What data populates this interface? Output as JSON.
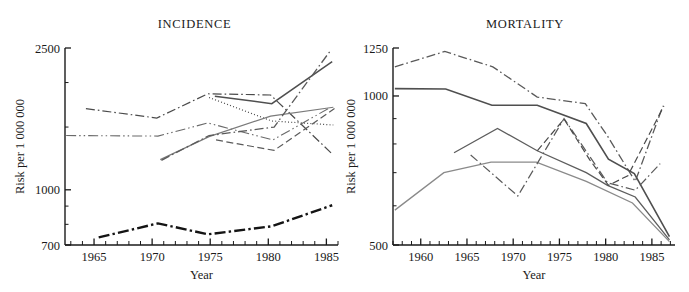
{
  "figure": {
    "panels": [
      "incidence",
      "mortality"
    ]
  },
  "chart_data": [
    {
      "type": "line",
      "title": "INCIDENCE",
      "xlabel": "Year",
      "ylabel": "Risk per 1 000 000",
      "yscale": "log",
      "ylim": [
        700,
        2500
      ],
      "ytick_labels": [
        "2500",
        "1000",
        "700"
      ],
      "ytick_values": [
        2500,
        1000,
        700
      ],
      "y_minor_ticks": [
        2000,
        1500,
        900,
        800
      ],
      "xlim": [
        1962.5,
        1986
      ],
      "xtick_labels": [
        "1965",
        "1970",
        "1975",
        "1980",
        "1985"
      ],
      "xtick_values": [
        1965,
        1970,
        1975,
        1980,
        1985
      ],
      "x_minor_interval": 1,
      "grid": false,
      "legend": "none",
      "series": [
        {
          "name": "series-1",
          "style": "dashdot",
          "color": "#4b4b4b",
          "width": 1.2,
          "x": [
            1964.3,
            1970.4,
            1974.8,
            1980.2,
            1985.4
          ],
          "y": [
            1690,
            1590,
            1860,
            1845,
            1270
          ]
        },
        {
          "name": "series-2",
          "style": "dashdotdot",
          "color": "#6a6a6a",
          "width": 1.1,
          "x": [
            1962.6,
            1970.5,
            1974.8,
            1980.4,
            1985.3
          ],
          "y": [
            1420,
            1415,
            1540,
            1380,
            1700
          ]
        },
        {
          "name": "series-3",
          "style": "dotted",
          "color": "#4b4b4b",
          "width": 1.2,
          "x": [
            1974.9,
            1980.3,
            1985.6
          ],
          "y": [
            1815,
            1560,
            1520
          ]
        },
        {
          "name": "series-4",
          "style": "solid",
          "color": "#4f4f4f",
          "width": 1.5,
          "x": [
            1975.4,
            1980.3,
            1985.5
          ],
          "y": [
            1830,
            1745,
            2290
          ]
        },
        {
          "name": "series-5",
          "style": "solid",
          "color": "#7a7a7a",
          "width": 1.2,
          "x": [
            1970.7,
            1974.9,
            1980.2,
            1985.6
          ],
          "y": [
            1215,
            1410,
            1610,
            1705
          ]
        },
        {
          "name": "series-6",
          "style": "dashdot",
          "color": "#5a5a5a",
          "width": 1.3,
          "x": [
            1970.8,
            1974.9,
            1980.5,
            1985.4
          ],
          "y": [
            1210,
            1420,
            1500,
            2470
          ]
        },
        {
          "name": "series-7",
          "style": "dashed",
          "color": "#5a5a5a",
          "width": 1.2,
          "x": [
            1975.5,
            1980.5,
            1985.7
          ],
          "y": [
            1380,
            1290,
            1690
          ]
        },
        {
          "name": "series-8",
          "style": "dashdot-thick",
          "color": "#141414",
          "width": 2.4,
          "x": [
            1965.4,
            1970.5,
            1974.8,
            1980.3,
            1985.5
          ],
          "y": [
            735,
            805,
            750,
            790,
            905
          ]
        }
      ]
    },
    {
      "type": "line",
      "title": "MORTALITY",
      "xlabel": "Year",
      "ylabel": "Risk per 1 000 000",
      "yscale": "log",
      "ylim": [
        500,
        1250
      ],
      "ytick_labels": [
        "1250",
        "1000",
        "500"
      ],
      "ytick_values": [
        1250,
        1000,
        500
      ],
      "y_minor_ticks": [
        900,
        800,
        700,
        600
      ],
      "xlim": [
        1957,
        1987.5
      ],
      "xtick_labels": [
        "1960",
        "1965",
        "1970",
        "1975",
        "1980",
        "1985"
      ],
      "xtick_values": [
        1960,
        1965,
        1970,
        1975,
        1980,
        1985
      ],
      "x_minor_interval": 1,
      "grid": false,
      "legend": "none",
      "series": [
        {
          "name": "series-1",
          "style": "dashdot",
          "color": "#5a5a5a",
          "width": 1.3,
          "x": [
            1957.2,
            1962.6,
            1967.8,
            1972.6,
            1977.8,
            1980.2,
            1983.2,
            1986.2
          ],
          "y": [
            1145,
            1230,
            1145,
            995,
            965,
            830,
            672,
            955
          ]
        },
        {
          "name": "series-2",
          "style": "solid",
          "color": "#4f4f4f",
          "width": 1.6,
          "x": [
            1957.2,
            1962.7,
            1967.7,
            1972.6,
            1977.9,
            1980.3,
            1983.1,
            1986.9
          ],
          "y": [
            1035,
            1033,
            958,
            958,
            880,
            745,
            697,
            520
          ]
        },
        {
          "name": "series-3",
          "style": "solid",
          "color": "#5d5d5d",
          "width": 1.3,
          "x": [
            1963.6,
            1968.3,
            1972.6,
            1977.9,
            1980.2,
            1983.2,
            1986.9
          ],
          "y": [
            768,
            860,
            775,
            700,
            660,
            625,
            512
          ]
        },
        {
          "name": "series-4",
          "style": "solid",
          "color": "#8a8a8a",
          "width": 1.3,
          "x": [
            1957.2,
            1962.5,
            1967.6,
            1972.5,
            1977.9,
            1982.9,
            1986.9
          ],
          "y": [
            588,
            700,
            735,
            735,
            672,
            608,
            508
          ]
        },
        {
          "name": "series-5",
          "style": "dashdot",
          "color": "#5a5a5a",
          "width": 1.2,
          "x": [
            1965.4,
            1970.5,
            1975.5,
            1980.2,
            1983.2,
            1985.9
          ],
          "y": [
            760,
            628,
            900,
            668,
            645,
            730
          ]
        },
        {
          "name": "series-6",
          "style": "dashed",
          "color": "#4b4b4b",
          "width": 1.2,
          "x": [
            1972.6,
            1975.5,
            1978.3,
            1980.3,
            1982.4,
            1986.3
          ],
          "y": [
            775,
            898,
            742,
            660,
            690,
            955
          ]
        }
      ]
    }
  ]
}
